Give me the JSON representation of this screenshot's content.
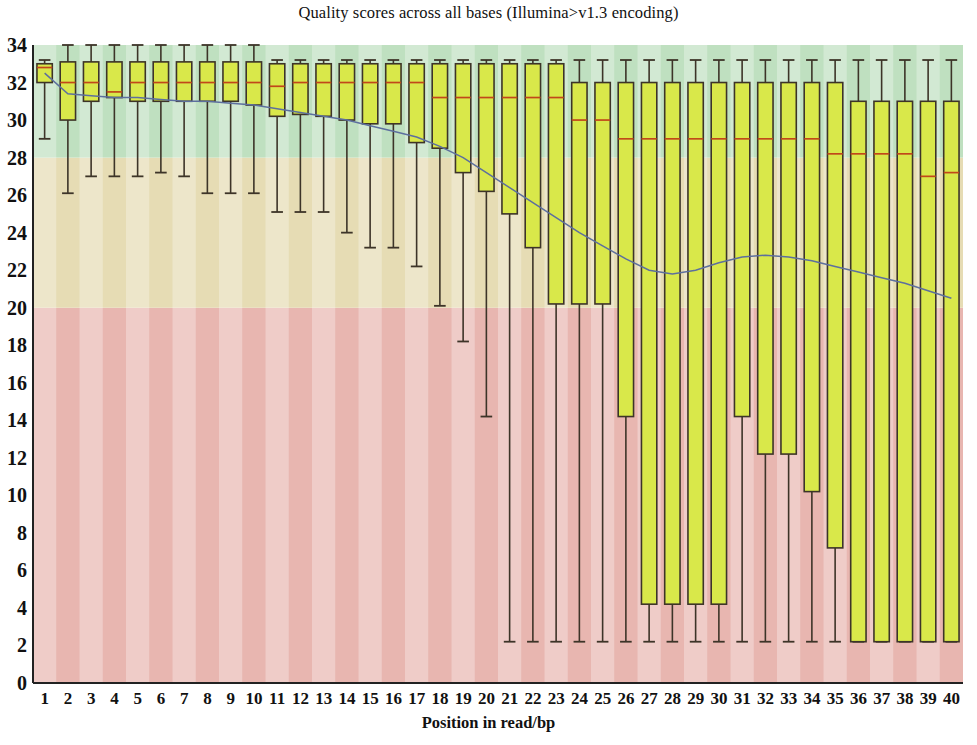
{
  "chart_data": {
    "type": "bar",
    "chart_kind": "boxplot",
    "title": "Quality scores across all bases (Illumina>v1.3 encoding)",
    "subtitle": "",
    "xlabel": "Position in read/bp",
    "ylabel": "",
    "xlim": [
      0.5,
      40.5
    ],
    "ylim": [
      0,
      34
    ],
    "ytick_labels": [
      "0",
      "2",
      "4",
      "6",
      "8",
      "10",
      "12",
      "14",
      "16",
      "18",
      "20",
      "22",
      "24",
      "26",
      "28",
      "30",
      "32",
      "34"
    ],
    "ytick_values": [
      0,
      2,
      4,
      6,
      8,
      10,
      12,
      14,
      16,
      18,
      20,
      22,
      24,
      26,
      28,
      30,
      32,
      34
    ],
    "grid": false,
    "legend": "none",
    "background_bands": [
      {
        "name": "poor-quality-band",
        "from": 0,
        "to": 20,
        "color": "#e8b6b0"
      },
      {
        "name": "medium-quality-band",
        "from": 20,
        "to": 28,
        "color": "#e6dcb4"
      },
      {
        "name": "good-quality-band",
        "from": 28,
        "to": 34,
        "color": "#bfe0c0"
      }
    ],
    "box_fill_color": "#d9e84a",
    "box_line_color": "#3d3428",
    "median_color": "#c1481a",
    "mean_line_color": "#5d6f9e",
    "whisker_color": "#3d3428",
    "categories": [
      1,
      2,
      3,
      4,
      5,
      6,
      7,
      8,
      9,
      10,
      11,
      12,
      13,
      14,
      15,
      16,
      17,
      18,
      19,
      20,
      21,
      22,
      23,
      24,
      25,
      26,
      27,
      28,
      29,
      30,
      31,
      32,
      33,
      34,
      35,
      36,
      37,
      38,
      39,
      40
    ],
    "series": [
      {
        "name": "Quality per base (box = 25th-75th percentile, whisker = 10th-90th percentile)",
        "boxes": [
          {
            "pos": 1,
            "whisker_low": 29.0,
            "q1": 32.0,
            "median": 32.8,
            "q3": 33.0,
            "whisker_high": 33.2
          },
          {
            "pos": 2,
            "whisker_low": 26.1,
            "q1": 30.0,
            "median": 32.0,
            "q3": 33.1,
            "whisker_high": 34.0
          },
          {
            "pos": 3,
            "whisker_low": 27.0,
            "q1": 31.0,
            "median": 32.0,
            "q3": 33.1,
            "whisker_high": 34.0
          },
          {
            "pos": 4,
            "whisker_low": 27.0,
            "q1": 31.2,
            "median": 31.5,
            "q3": 33.1,
            "whisker_high": 34.0
          },
          {
            "pos": 5,
            "whisker_low": 27.0,
            "q1": 31.0,
            "median": 32.0,
            "q3": 33.1,
            "whisker_high": 34.0
          },
          {
            "pos": 6,
            "whisker_low": 27.2,
            "q1": 31.0,
            "median": 32.0,
            "q3": 33.1,
            "whisker_high": 34.0
          },
          {
            "pos": 7,
            "whisker_low": 27.0,
            "q1": 31.0,
            "median": 32.0,
            "q3": 33.1,
            "whisker_high": 34.0
          },
          {
            "pos": 8,
            "whisker_low": 26.1,
            "q1": 31.0,
            "median": 32.0,
            "q3": 33.1,
            "whisker_high": 34.0
          },
          {
            "pos": 9,
            "whisker_low": 26.1,
            "q1": 31.0,
            "median": 32.0,
            "q3": 33.1,
            "whisker_high": 34.0
          },
          {
            "pos": 10,
            "whisker_low": 26.1,
            "q1": 30.8,
            "median": 32.0,
            "q3": 33.1,
            "whisker_high": 34.0
          },
          {
            "pos": 11,
            "whisker_low": 25.1,
            "q1": 30.2,
            "median": 31.8,
            "q3": 33.0,
            "whisker_high": 33.2
          },
          {
            "pos": 12,
            "whisker_low": 25.1,
            "q1": 30.3,
            "median": 32.0,
            "q3": 33.0,
            "whisker_high": 33.2
          },
          {
            "pos": 13,
            "whisker_low": 25.1,
            "q1": 30.2,
            "median": 32.0,
            "q3": 33.0,
            "whisker_high": 33.2
          },
          {
            "pos": 14,
            "whisker_low": 24.0,
            "q1": 30.0,
            "median": 32.0,
            "q3": 33.0,
            "whisker_high": 33.2
          },
          {
            "pos": 15,
            "whisker_low": 23.2,
            "q1": 29.8,
            "median": 32.0,
            "q3": 33.0,
            "whisker_high": 33.2
          },
          {
            "pos": 16,
            "whisker_low": 23.2,
            "q1": 29.8,
            "median": 32.0,
            "q3": 33.0,
            "whisker_high": 33.2
          },
          {
            "pos": 17,
            "whisker_low": 22.2,
            "q1": 28.8,
            "median": 32.0,
            "q3": 33.0,
            "whisker_high": 33.2
          },
          {
            "pos": 18,
            "whisker_low": 20.1,
            "q1": 28.5,
            "median": 31.2,
            "q3": 33.0,
            "whisker_high": 33.2
          },
          {
            "pos": 19,
            "whisker_low": 18.2,
            "q1": 27.2,
            "median": 31.2,
            "q3": 33.0,
            "whisker_high": 33.2
          },
          {
            "pos": 20,
            "whisker_low": 14.2,
            "q1": 26.2,
            "median": 31.2,
            "q3": 33.0,
            "whisker_high": 33.2
          },
          {
            "pos": 21,
            "whisker_low": 2.2,
            "q1": 25.0,
            "median": 31.2,
            "q3": 33.0,
            "whisker_high": 33.2
          },
          {
            "pos": 22,
            "whisker_low": 2.2,
            "q1": 23.2,
            "median": 31.2,
            "q3": 33.0,
            "whisker_high": 33.2
          },
          {
            "pos": 23,
            "whisker_low": 2.2,
            "q1": 20.2,
            "median": 31.2,
            "q3": 33.0,
            "whisker_high": 33.2
          },
          {
            "pos": 24,
            "whisker_low": 2.2,
            "q1": 20.2,
            "median": 30.0,
            "q3": 32.0,
            "whisker_high": 33.2
          },
          {
            "pos": 25,
            "whisker_low": 2.2,
            "q1": 20.2,
            "median": 30.0,
            "q3": 32.0,
            "whisker_high": 33.2
          },
          {
            "pos": 26,
            "whisker_low": 2.2,
            "q1": 14.2,
            "median": 29.0,
            "q3": 32.0,
            "whisker_high": 33.2
          },
          {
            "pos": 27,
            "whisker_low": 2.2,
            "q1": 4.2,
            "median": 29.0,
            "q3": 32.0,
            "whisker_high": 33.2
          },
          {
            "pos": 28,
            "whisker_low": 2.2,
            "q1": 4.2,
            "median": 29.0,
            "q3": 32.0,
            "whisker_high": 33.2
          },
          {
            "pos": 29,
            "whisker_low": 2.2,
            "q1": 4.2,
            "median": 29.0,
            "q3": 32.0,
            "whisker_high": 33.2
          },
          {
            "pos": 30,
            "whisker_low": 2.2,
            "q1": 4.2,
            "median": 29.0,
            "q3": 32.0,
            "whisker_high": 33.2
          },
          {
            "pos": 31,
            "whisker_low": 2.2,
            "q1": 14.2,
            "median": 29.0,
            "q3": 32.0,
            "whisker_high": 33.2
          },
          {
            "pos": 32,
            "whisker_low": 2.2,
            "q1": 12.2,
            "median": 29.0,
            "q3": 32.0,
            "whisker_high": 33.2
          },
          {
            "pos": 33,
            "whisker_low": 2.2,
            "q1": 12.2,
            "median": 29.0,
            "q3": 32.0,
            "whisker_high": 33.2
          },
          {
            "pos": 34,
            "whisker_low": 2.2,
            "q1": 10.2,
            "median": 29.0,
            "q3": 32.0,
            "whisker_high": 33.2
          },
          {
            "pos": 35,
            "whisker_low": 2.2,
            "q1": 7.2,
            "median": 28.2,
            "q3": 32.0,
            "whisker_high": 33.2
          },
          {
            "pos": 36,
            "whisker_low": 2.2,
            "q1": 2.2,
            "median": 28.2,
            "q3": 31.0,
            "whisker_high": 33.2
          },
          {
            "pos": 37,
            "whisker_low": 2.2,
            "q1": 2.2,
            "median": 28.2,
            "q3": 31.0,
            "whisker_high": 33.2
          },
          {
            "pos": 38,
            "whisker_low": 2.2,
            "q1": 2.2,
            "median": 28.2,
            "q3": 31.0,
            "whisker_high": 33.2
          },
          {
            "pos": 39,
            "whisker_low": 2.2,
            "q1": 2.2,
            "median": 27.0,
            "q3": 31.0,
            "whisker_high": 33.2
          },
          {
            "pos": 40,
            "whisker_low": 2.2,
            "q1": 2.2,
            "median": 27.2,
            "q3": 31.0,
            "whisker_high": 33.2
          }
        ]
      }
    ],
    "mean_line": {
      "name": "Mean quality",
      "x": [
        1,
        2,
        3,
        4,
        5,
        6,
        7,
        8,
        9,
        10,
        11,
        12,
        13,
        14,
        15,
        16,
        17,
        18,
        19,
        20,
        21,
        22,
        23,
        24,
        25,
        26,
        27,
        28,
        29,
        30,
        31,
        32,
        33,
        34,
        35,
        36,
        37,
        38,
        39,
        40
      ],
      "values": [
        32.5,
        31.4,
        31.3,
        31.2,
        31.2,
        31.1,
        31.0,
        31.0,
        30.9,
        30.8,
        30.6,
        30.4,
        30.2,
        30.0,
        29.7,
        29.4,
        29.1,
        28.6,
        28.0,
        27.2,
        26.4,
        25.6,
        24.8,
        24.0,
        23.3,
        22.6,
        22.0,
        21.8,
        22.0,
        22.4,
        22.7,
        22.8,
        22.7,
        22.5,
        22.2,
        21.9,
        21.6,
        21.3,
        20.9,
        20.5
      ]
    }
  }
}
